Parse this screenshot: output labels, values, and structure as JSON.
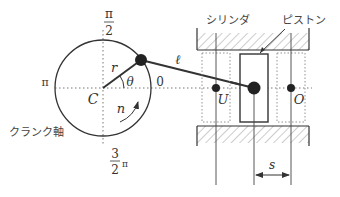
{
  "labels": {
    "top_angle_num": "π",
    "top_angle_den": "2",
    "left_angle": "π",
    "right_angle": "0",
    "bottom_angle_num": "3",
    "bottom_angle_den": "2",
    "bottom_angle_pi": "π",
    "crank_center": "C",
    "crank_radius": "r",
    "crank_angle": "θ",
    "rotation_speed": "n",
    "rod_length": "ℓ",
    "bottom_dead_center": "U",
    "top_dead_center": "O",
    "stroke": "s",
    "cylinder": "シリンダ",
    "piston": "ピストン",
    "crankshaft": "クランク軸"
  },
  "colors": {
    "line": "#333333",
    "dotted": "#777777",
    "hatch": "#999999",
    "background": "#ffffff"
  }
}
